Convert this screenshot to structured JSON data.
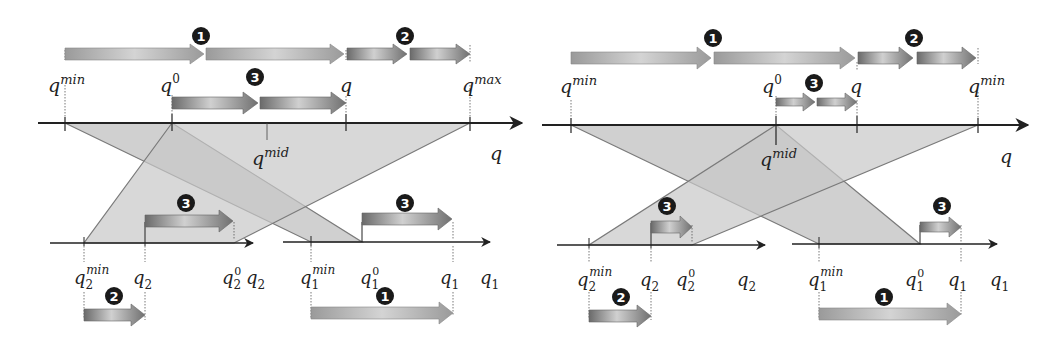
{
  "figure": {
    "panels": [
      {
        "name": "left-panel",
        "main_axis": {
          "label": "q",
          "y": 123,
          "x_start": 38,
          "x_end": 522
        },
        "ticks": [
          {
            "id": "qmin",
            "x": 65,
            "base": "q",
            "sup": "min",
            "sub": ""
          },
          {
            "id": "q0",
            "x": 172,
            "base": "q",
            "sup": "0",
            "sub": ""
          },
          {
            "id": "q",
            "x": 346,
            "base": "q",
            "sup": "",
            "sub": ""
          },
          {
            "id": "qmax",
            "x": 470,
            "base": "q",
            "sup": "max",
            "sub": ""
          }
        ],
        "mid": {
          "x": 267,
          "base": "q",
          "sup": "mid"
        },
        "sub_axis_2": {
          "label_base": "q",
          "label_sub": "2",
          "y": 243,
          "x_start": 50,
          "x_end": 253,
          "ticks": [
            {
              "x": 84,
              "base": "q",
              "sup": "min",
              "sub": "2"
            },
            {
              "x": 145,
              "base": "q",
              "sup": "",
              "sub": "2"
            },
            {
              "x": 234,
              "base": "q",
              "sup": "0",
              "sub": "2"
            }
          ]
        },
        "sub_axis_1": {
          "label_base": "q",
          "label_sub": "1",
          "y": 242,
          "x_start": 283,
          "x_end": 490,
          "ticks": [
            {
              "x": 311,
              "base": "q",
              "sup": "min",
              "sub": "1"
            },
            {
              "x": 362,
              "base": "q",
              "sup": "0",
              "sub": "1"
            },
            {
              "x": 453,
              "base": "q",
              "sup": "",
              "sub": "1"
            }
          ]
        },
        "markers": [
          {
            "n": "1",
            "x": 201,
            "y": 36
          },
          {
            "n": "2",
            "x": 405,
            "y": 36
          },
          {
            "n": "3",
            "x": 255,
            "y": 77
          },
          {
            "n": "3",
            "x": 186,
            "y": 203
          },
          {
            "n": "3",
            "x": 405,
            "y": 203
          },
          {
            "n": "2",
            "x": 114,
            "y": 296
          },
          {
            "n": "1",
            "x": 385,
            "y": 296
          }
        ]
      },
      {
        "name": "right-panel",
        "main_axis": {
          "label": "q",
          "y": 125,
          "x_start": 542,
          "x_end": 1028
        },
        "ticks": [
          {
            "id": "qmin",
            "x": 571,
            "base": "q",
            "sup": "min",
            "sub": ""
          },
          {
            "id": "q0",
            "x": 776,
            "base": "q",
            "sup": "0",
            "sub": ""
          },
          {
            "id": "q",
            "x": 857,
            "base": "q",
            "sup": "",
            "sub": ""
          },
          {
            "id": "qmin-right",
            "x": 978,
            "base": "q",
            "sup": "min",
            "sub": ""
          }
        ],
        "mid": {
          "x": 776,
          "base": "q",
          "sup": "mid"
        },
        "sub_axis_2": {
          "label_base": "q",
          "label_sub": "2",
          "y": 245,
          "x_start": 557,
          "x_end": 765,
          "ticks": [
            {
              "x": 589,
              "base": "q",
              "sup": "min",
              "sub": "2"
            },
            {
              "x": 651,
              "base": "q",
              "sup": "",
              "sub": "2"
            },
            {
              "x": 692,
              "base": "q",
              "sup": "0",
              "sub": "2"
            }
          ]
        },
        "sub_axis_1": {
          "label_base": "q",
          "label_sub": "1",
          "y": 244,
          "x_start": 792,
          "x_end": 997,
          "ticks": [
            {
              "x": 819,
              "base": "q",
              "sup": "min",
              "sub": "1"
            },
            {
              "x": 920,
              "base": "q",
              "sup": "0",
              "sub": "1"
            },
            {
              "x": 961,
              "base": "q",
              "sup": "",
              "sub": "1"
            }
          ]
        },
        "markers": [
          {
            "n": "1",
            "x": 713,
            "y": 38
          },
          {
            "n": "2",
            "x": 914,
            "y": 38
          },
          {
            "n": "3",
            "x": 814,
            "y": 83
          },
          {
            "n": "3",
            "x": 667,
            "y": 206
          },
          {
            "n": "3",
            "x": 942,
            "y": 206
          },
          {
            "n": "2",
            "x": 621,
            "y": 297
          },
          {
            "n": "1",
            "x": 884,
            "y": 297
          }
        ]
      }
    ],
    "colors": {
      "band_fill": "#c8c8c8",
      "band_stroke": "#7a7a7a",
      "axis": "#222222",
      "marker_bg": "#1a1a1a",
      "arrow_light": "#a0a0a0",
      "arrow_dark": "#707070"
    }
  }
}
